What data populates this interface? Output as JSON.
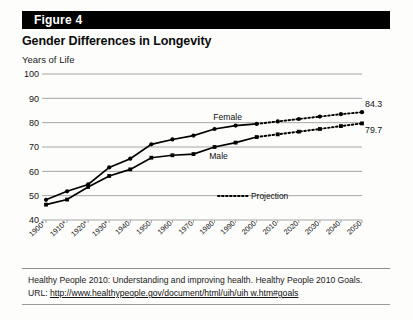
{
  "figure": {
    "banner_label": "Figure 4",
    "title": "Gender Differences in Longevity",
    "axis_unit_label": "Years of Life"
  },
  "footnote": {
    "line1": "Healthy People 2010: Understanding and improving health. Healthy People 2010 Goals.",
    "url_prefix": "URL: ",
    "url": "http://www.healthypeople.gov/document/html/uih/uih w.htm#goals"
  },
  "legend": {
    "projection_label": "Projection"
  },
  "colors": {
    "banner_background": "#000000",
    "banner_text": "#ffffff",
    "series": "#000000",
    "gridline": "#8f8f8f",
    "page_background": "#fdfdfb"
  },
  "chart_data": {
    "type": "line",
    "title": "Gender Differences in Longevity",
    "xlabel": "",
    "ylabel": "Years of Life",
    "ylim": [
      40,
      100
    ],
    "yticks": [
      40,
      50,
      60,
      70,
      80,
      90,
      100
    ],
    "grid": true,
    "legend_position": "inline",
    "categories": [
      "1900*",
      "1910*",
      "1920*",
      "1930*",
      "1940",
      "1950",
      "1960",
      "1970",
      "1980",
      "1990",
      "2000",
      "2010",
      "2020",
      "2030",
      "2040",
      "2050"
    ],
    "projection_starts_at": "2000",
    "series": [
      {
        "name": "Female",
        "label": "Female",
        "end_value_label": "84.3",
        "values": [
          48.3,
          51.8,
          54.6,
          61.6,
          65.2,
          71.1,
          73.1,
          74.7,
          77.4,
          78.8,
          79.5,
          80.5,
          81.5,
          82.5,
          83.5,
          84.3
        ]
      },
      {
        "name": "Male",
        "label": "Male",
        "end_value_label": "79.7",
        "values": [
          46.3,
          48.4,
          53.6,
          58.1,
          60.8,
          65.6,
          66.6,
          67.1,
          70.0,
          71.8,
          74.1,
          75.2,
          76.3,
          77.4,
          78.6,
          79.7
        ]
      }
    ]
  }
}
